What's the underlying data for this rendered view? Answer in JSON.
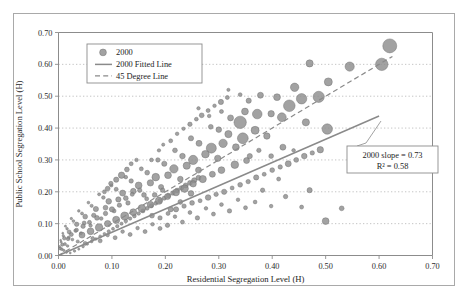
{
  "chart_data": {
    "type": "scatter",
    "title": "",
    "xlabel": "Residential Segregation Level (H)",
    "ylabel": "Public School Segregation Level (H)",
    "xlim": [
      0.0,
      0.7
    ],
    "ylim": [
      0.0,
      0.7
    ],
    "xticks": [
      "0.00",
      "0.10",
      "0.20",
      "0.30",
      "0.40",
      "0.50",
      "0.60",
      "0.70"
    ],
    "yticks": [
      "0.00",
      "0.10",
      "0.20",
      "0.30",
      "0.40",
      "0.50",
      "0.60",
      "0.70"
    ],
    "grid": "horizontal-dotted",
    "legend_position": "top-left-inside",
    "marker_style": "bubble-size-varies",
    "legend": [
      {
        "key": "points",
        "label": "2000",
        "symbol": "circle",
        "color": "#8d8d8d"
      },
      {
        "key": "fitted",
        "label": "2000 Fitted Line",
        "symbol": "solid-line",
        "color": "#8a8a8a"
      },
      {
        "key": "diagonal",
        "label": "45 Degree Line",
        "symbol": "dashed-line",
        "color": "#8a8a8a"
      }
    ],
    "annotations": [
      {
        "key": "slope",
        "text": "2000 slope = 0.73"
      },
      {
        "key": "r2",
        "text": "R² = 0.58"
      }
    ],
    "fitted_line": {
      "slope": 0.73,
      "intercept": 0.0,
      "r2": 0.58,
      "x_start": 0.0,
      "x_end": 0.6,
      "y_start": 0.0,
      "y_end": 0.438
    },
    "reference_line": {
      "slope": 1.0,
      "intercept": 0.0,
      "x_start": 0.0,
      "x_end": 0.625,
      "y_start": 0.0,
      "y_end": 0.625
    },
    "points": [
      [
        0.62,
        0.658,
        7.0
      ],
      [
        0.605,
        0.6,
        6.2
      ],
      [
        0.545,
        0.593,
        4.6
      ],
      [
        0.47,
        0.603,
        3.6
      ],
      [
        0.505,
        0.545,
        4.0
      ],
      [
        0.442,
        0.528,
        4.2
      ],
      [
        0.487,
        0.498,
        5.6
      ],
      [
        0.409,
        0.497,
        3.4
      ],
      [
        0.455,
        0.492,
        5.2
      ],
      [
        0.432,
        0.47,
        5.8
      ],
      [
        0.378,
        0.503,
        3.0
      ],
      [
        0.356,
        0.486,
        2.6
      ],
      [
        0.503,
        0.397,
        5.2
      ],
      [
        0.463,
        0.418,
        3.6
      ],
      [
        0.418,
        0.434,
        4.4
      ],
      [
        0.398,
        0.445,
        3.2
      ],
      [
        0.372,
        0.444,
        4.8
      ],
      [
        0.349,
        0.452,
        3.4
      ],
      [
        0.34,
        0.418,
        6.2
      ],
      [
        0.322,
        0.432,
        3.0
      ],
      [
        0.368,
        0.393,
        4.0
      ],
      [
        0.39,
        0.375,
        3.2
      ],
      [
        0.345,
        0.368,
        5.4
      ],
      [
        0.318,
        0.381,
        3.6
      ],
      [
        0.3,
        0.395,
        2.8
      ],
      [
        0.285,
        0.404,
        2.4
      ],
      [
        0.308,
        0.352,
        4.2
      ],
      [
        0.332,
        0.34,
        3.4
      ],
      [
        0.286,
        0.337,
        5.0
      ],
      [
        0.263,
        0.352,
        3.0
      ],
      [
        0.248,
        0.368,
        2.6
      ],
      [
        0.275,
        0.318,
        3.8
      ],
      [
        0.298,
        0.305,
        3.2
      ],
      [
        0.252,
        0.3,
        4.6
      ],
      [
        0.232,
        0.312,
        2.8
      ],
      [
        0.218,
        0.33,
        2.4
      ],
      [
        0.24,
        0.282,
        3.6
      ],
      [
        0.262,
        0.268,
        3.0
      ],
      [
        0.216,
        0.272,
        4.2
      ],
      [
        0.198,
        0.288,
        2.6
      ],
      [
        0.186,
        0.3,
        2.2
      ],
      [
        0.205,
        0.252,
        3.4
      ],
      [
        0.228,
        0.24,
        2.8
      ],
      [
        0.182,
        0.246,
        3.8
      ],
      [
        0.166,
        0.26,
        2.4
      ],
      [
        0.155,
        0.272,
        2.0
      ],
      [
        0.172,
        0.228,
        3.2
      ],
      [
        0.192,
        0.215,
        2.6
      ],
      [
        0.15,
        0.22,
        3.4
      ],
      [
        0.136,
        0.234,
        2.2
      ],
      [
        0.126,
        0.246,
        1.8
      ],
      [
        0.14,
        0.202,
        2.8
      ],
      [
        0.16,
        0.19,
        2.4
      ],
      [
        0.12,
        0.196,
        3.0
      ],
      [
        0.108,
        0.208,
        2.0
      ],
      [
        0.099,
        0.22,
        1.6
      ],
      [
        0.112,
        0.176,
        2.6
      ],
      [
        0.13,
        0.165,
        2.2
      ],
      [
        0.094,
        0.17,
        2.8
      ],
      [
        0.084,
        0.182,
        1.8
      ],
      [
        0.076,
        0.192,
        1.5
      ],
      [
        0.088,
        0.15,
        2.4
      ],
      [
        0.104,
        0.14,
        2.0
      ],
      [
        0.07,
        0.146,
        2.6
      ],
      [
        0.062,
        0.156,
        1.6
      ],
      [
        0.056,
        0.166,
        1.4
      ],
      [
        0.066,
        0.126,
        2.2
      ],
      [
        0.08,
        0.116,
        1.8
      ],
      [
        0.05,
        0.122,
        2.4
      ],
      [
        0.044,
        0.132,
        1.5
      ],
      [
        0.038,
        0.14,
        1.3
      ],
      [
        0.048,
        0.102,
        2.0
      ],
      [
        0.06,
        0.094,
        1.7
      ],
      [
        0.034,
        0.098,
        2.2
      ],
      [
        0.028,
        0.108,
        1.4
      ],
      [
        0.024,
        0.116,
        1.2
      ],
      [
        0.032,
        0.078,
        1.8
      ],
      [
        0.042,
        0.07,
        1.5
      ],
      [
        0.02,
        0.074,
        2.0
      ],
      [
        0.016,
        0.084,
        1.3
      ],
      [
        0.013,
        0.092,
        1.1
      ],
      [
        0.019,
        0.056,
        1.6
      ],
      [
        0.026,
        0.05,
        1.4
      ],
      [
        0.011,
        0.054,
        1.8
      ],
      [
        0.009,
        0.062,
        1.2
      ],
      [
        0.008,
        0.07,
        1.0
      ],
      [
        0.012,
        0.036,
        1.5
      ],
      [
        0.017,
        0.03,
        1.3
      ],
      [
        0.007,
        0.034,
        1.6
      ],
      [
        0.005,
        0.042,
        1.1
      ],
      [
        0.004,
        0.048,
        0.9
      ],
      [
        0.006,
        0.02,
        1.4
      ],
      [
        0.01,
        0.016,
        1.2
      ],
      [
        0.003,
        0.022,
        1.4
      ],
      [
        0.002,
        0.028,
        1.0
      ],
      [
        0.015,
        0.01,
        1.1
      ],
      [
        0.022,
        0.008,
        1.0
      ],
      [
        0.03,
        0.014,
        1.2
      ],
      [
        0.038,
        0.02,
        1.1
      ],
      [
        0.046,
        0.028,
        1.3
      ],
      [
        0.054,
        0.036,
        1.2
      ],
      [
        0.062,
        0.044,
        1.4
      ],
      [
        0.07,
        0.052,
        1.3
      ],
      [
        0.078,
        0.06,
        1.5
      ],
      [
        0.086,
        0.068,
        1.4
      ],
      [
        0.094,
        0.076,
        1.6
      ],
      [
        0.102,
        0.084,
        1.5
      ],
      [
        0.11,
        0.092,
        1.7
      ],
      [
        0.118,
        0.1,
        1.6
      ],
      [
        0.126,
        0.108,
        1.8
      ],
      [
        0.134,
        0.116,
        1.7
      ],
      [
        0.142,
        0.124,
        1.9
      ],
      [
        0.15,
        0.132,
        1.8
      ],
      [
        0.158,
        0.14,
        2.0
      ],
      [
        0.166,
        0.148,
        1.9
      ],
      [
        0.174,
        0.156,
        2.1
      ],
      [
        0.182,
        0.164,
        2.0
      ],
      [
        0.19,
        0.172,
        2.2
      ],
      [
        0.198,
        0.18,
        2.1
      ],
      [
        0.206,
        0.188,
        2.3
      ],
      [
        0.214,
        0.196,
        2.2
      ],
      [
        0.222,
        0.204,
        2.4
      ],
      [
        0.23,
        0.212,
        2.3
      ],
      [
        0.238,
        0.22,
        2.5
      ],
      [
        0.246,
        0.228,
        2.4
      ],
      [
        0.254,
        0.236,
        2.6
      ],
      [
        0.262,
        0.244,
        2.5
      ],
      [
        0.118,
        0.252,
        3.2
      ],
      [
        0.128,
        0.27,
        2.4
      ],
      [
        0.108,
        0.238,
        2.6
      ],
      [
        0.098,
        0.226,
        2.2
      ],
      [
        0.136,
        0.288,
        2.0
      ],
      [
        0.146,
        0.3,
        1.8
      ],
      [
        0.092,
        0.21,
        2.4
      ],
      [
        0.086,
        0.2,
        2.0
      ],
      [
        0.174,
        0.3,
        1.9
      ],
      [
        0.188,
        0.33,
        1.7
      ],
      [
        0.196,
        0.348,
        1.6
      ],
      [
        0.21,
        0.36,
        2.0
      ],
      [
        0.222,
        0.382,
        1.8
      ],
      [
        0.234,
        0.398,
        1.7
      ],
      [
        0.246,
        0.412,
        2.2
      ],
      [
        0.258,
        0.428,
        1.9
      ],
      [
        0.268,
        0.44,
        2.4
      ],
      [
        0.28,
        0.455,
        2.0
      ],
      [
        0.292,
        0.47,
        1.8
      ],
      [
        0.304,
        0.482,
        2.6
      ],
      [
        0.316,
        0.496,
        2.0
      ],
      [
        0.175,
        0.125,
        2.4
      ],
      [
        0.19,
        0.118,
        2.2
      ],
      [
        0.205,
        0.132,
        2.0
      ],
      [
        0.22,
        0.145,
        2.6
      ],
      [
        0.235,
        0.155,
        2.2
      ],
      [
        0.25,
        0.165,
        2.4
      ],
      [
        0.265,
        0.172,
        2.0
      ],
      [
        0.28,
        0.182,
        2.8
      ],
      [
        0.295,
        0.192,
        2.2
      ],
      [
        0.31,
        0.2,
        2.6
      ],
      [
        0.325,
        0.212,
        2.0
      ],
      [
        0.34,
        0.222,
        2.4
      ],
      [
        0.355,
        0.232,
        2.2
      ],
      [
        0.37,
        0.245,
        2.6
      ],
      [
        0.385,
        0.255,
        2.0
      ],
      [
        0.4,
        0.268,
        2.4
      ],
      [
        0.415,
        0.278,
        2.2
      ],
      [
        0.43,
        0.288,
        3.0
      ],
      [
        0.445,
        0.3,
        2.4
      ],
      [
        0.46,
        0.312,
        2.8
      ],
      [
        0.475,
        0.322,
        2.2
      ],
      [
        0.49,
        0.332,
        3.2
      ],
      [
        0.33,
        0.285,
        3.8
      ],
      [
        0.352,
        0.298,
        3.0
      ],
      [
        0.305,
        0.268,
        3.4
      ],
      [
        0.288,
        0.255,
        3.0
      ],
      [
        0.27,
        0.24,
        3.6
      ],
      [
        0.252,
        0.225,
        3.2
      ],
      [
        0.236,
        0.21,
        3.8
      ],
      [
        0.22,
        0.198,
        3.4
      ],
      [
        0.204,
        0.185,
        3.0
      ],
      [
        0.188,
        0.172,
        3.6
      ],
      [
        0.172,
        0.16,
        3.2
      ],
      [
        0.156,
        0.148,
        3.8
      ],
      [
        0.14,
        0.136,
        3.4
      ],
      [
        0.124,
        0.124,
        4.0
      ],
      [
        0.108,
        0.112,
        3.6
      ],
      [
        0.092,
        0.1,
        3.2
      ],
      [
        0.076,
        0.088,
        3.8
      ],
      [
        0.06,
        0.076,
        3.4
      ],
      [
        0.044,
        0.064,
        3.0
      ],
      [
        0.5,
        0.108,
        3.4
      ],
      [
        0.53,
        0.148,
        2.4
      ],
      [
        0.47,
        0.205,
        2.6
      ],
      [
        0.455,
        0.152,
        2.0
      ],
      [
        0.44,
        0.33,
        1.8
      ],
      [
        0.425,
        0.185,
        2.2
      ],
      [
        0.412,
        0.24,
        2.0
      ],
      [
        0.398,
        0.155,
        1.8
      ],
      [
        0.382,
        0.205,
        2.2
      ],
      [
        0.368,
        0.168,
        1.9
      ],
      [
        0.35,
        0.15,
        2.0
      ],
      [
        0.336,
        0.175,
        1.8
      ],
      [
        0.32,
        0.14,
        2.2
      ],
      [
        0.305,
        0.16,
        1.9
      ],
      [
        0.29,
        0.13,
        2.0
      ],
      [
        0.276,
        0.148,
        1.8
      ],
      [
        0.26,
        0.118,
        2.2
      ],
      [
        0.246,
        0.135,
        1.9
      ],
      [
        0.232,
        0.105,
        2.0
      ],
      [
        0.218,
        0.122,
        1.8
      ],
      [
        0.204,
        0.095,
        2.2
      ],
      [
        0.19,
        0.085,
        2.0
      ],
      [
        0.176,
        0.098,
        1.8
      ],
      [
        0.162,
        0.075,
        2.0
      ],
      [
        0.148,
        0.086,
        1.8
      ],
      [
        0.134,
        0.066,
        2.0
      ],
      [
        0.12,
        0.075,
        1.8
      ],
      [
        0.106,
        0.056,
        2.0
      ],
      [
        0.092,
        0.064,
        1.8
      ],
      [
        0.078,
        0.046,
        2.0
      ],
      [
        0.064,
        0.054,
        1.8
      ],
      [
        0.05,
        0.038,
        2.0
      ],
      [
        0.036,
        0.044,
        1.6
      ],
      [
        0.305,
        0.452,
        2.0
      ],
      [
        0.282,
        0.438,
        1.8
      ],
      [
        0.262,
        0.462,
        1.7
      ],
      [
        0.34,
        0.505,
        1.9
      ],
      [
        0.318,
        0.52,
        1.6
      ],
      [
        0.42,
        0.34,
        3.0
      ],
      [
        0.398,
        0.312,
        2.4
      ],
      [
        0.375,
        0.33,
        2.2
      ],
      [
        0.358,
        0.312,
        2.6
      ],
      [
        0.248,
        0.195,
        2.8
      ],
      [
        0.228,
        0.168,
        2.4
      ],
      [
        0.21,
        0.145,
        2.6
      ],
      [
        0.195,
        0.205,
        2.2
      ],
      [
        0.18,
        0.19,
        2.4
      ],
      [
        0.165,
        0.178,
        2.0
      ],
      [
        0.152,
        0.205,
        2.2
      ],
      [
        0.138,
        0.192,
        2.0
      ],
      [
        0.126,
        0.18,
        2.4
      ],
      [
        0.114,
        0.158,
        2.2
      ],
      [
        0.1,
        0.145,
        2.6
      ],
      [
        0.088,
        0.132,
        2.2
      ],
      [
        0.072,
        0.118,
        2.4
      ],
      [
        0.058,
        0.104,
        2.0
      ],
      [
        0.046,
        0.092,
        2.2
      ],
      [
        0.034,
        0.08,
        1.8
      ],
      [
        0.024,
        0.066,
        2.0
      ],
      [
        0.018,
        0.052,
        1.8
      ]
    ]
  }
}
